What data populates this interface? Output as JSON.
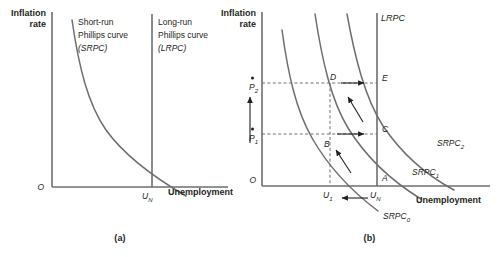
{
  "figure": {
    "panels": [
      {
        "id": "a",
        "caption": "(a)",
        "y_axis_label_line1": "Inflation",
        "y_axis_label_line2": "rate",
        "x_axis_label": "Unemployment",
        "origin_label": "O",
        "x_tick_label": "U",
        "x_tick_sub": "N",
        "annotations": [
          {
            "name": "srpc-note",
            "line1": "Short-run",
            "line2": "Phillips curve",
            "line3": "(SRPC)"
          },
          {
            "name": "lrpc-note",
            "line1": "Long-run",
            "line2": "Phillips curve",
            "line3": "(LRPC)"
          }
        ]
      },
      {
        "id": "b",
        "caption": "(b)",
        "y_axis_label_line1": "Inflation",
        "y_axis_label_line2": "rate",
        "x_axis_label": "Unemployment",
        "origin_label": "O",
        "lrpc_label": "LRPC",
        "curve_labels": [
          {
            "base": "SRPC",
            "sub": "0"
          },
          {
            "base": "SRPC",
            "sub": "1"
          },
          {
            "base": "SRPC",
            "sub": "2"
          }
        ],
        "y_tick_labels": [
          {
            "base": "P",
            "sub": "1",
            "dot": true
          },
          {
            "base": "P",
            "sub": "2",
            "dot": true
          }
        ],
        "x_tick_labels": [
          {
            "base": "U",
            "sub": "1"
          },
          {
            "base": "U",
            "sub": "N"
          }
        ],
        "points": [
          {
            "label": "A",
            "x_at": "U_N",
            "y_at": "0"
          },
          {
            "label": "B",
            "x_at": "U_1",
            "y_at": "P_1"
          },
          {
            "label": "C",
            "x_at": "U_N",
            "y_at": "P_1"
          },
          {
            "label": "D",
            "x_at": "U_1",
            "y_at": "P_2"
          },
          {
            "label": "E",
            "x_at": "U_N",
            "y_at": "P_2"
          }
        ],
        "movement_arrows": [
          {
            "name": "arrow-a-to-b",
            "direction": "up-left",
            "from": "A",
            "to": "B"
          },
          {
            "name": "arrow-b-to-c",
            "direction": "right",
            "from": "B",
            "to": "C"
          },
          {
            "name": "arrow-c-to-d",
            "direction": "up-left",
            "from": "C",
            "to": "D"
          },
          {
            "name": "arrow-d-to-e",
            "direction": "right",
            "from": "D",
            "to": "E"
          },
          {
            "name": "arrow-inflation-rising",
            "direction": "up"
          },
          {
            "name": "arrow-unemployment-falling",
            "direction": "left"
          }
        ]
      }
    ]
  },
  "colors": {
    "line": "#6d6e71",
    "text": "#231f20",
    "background": "#ffffff"
  }
}
